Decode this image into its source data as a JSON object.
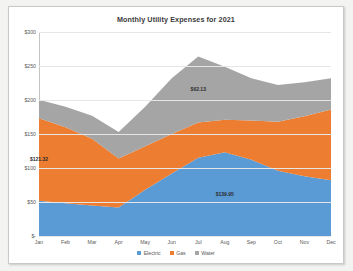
{
  "chart_data": {
    "type": "area",
    "stacked": true,
    "title": "Monthly Utility Expenses for 2021",
    "xlabel": "",
    "ylabel": "",
    "ylim": [
      0,
      300
    ],
    "yticks": [
      "$-",
      "$50",
      "$100",
      "$150",
      "$200",
      "$250",
      "$300"
    ],
    "ytick_values": [
      0,
      50,
      100,
      150,
      200,
      250,
      300
    ],
    "grid": true,
    "legend_position": "bottom",
    "categories": [
      "Jan",
      "Feb",
      "Mar",
      "Apr",
      "May",
      "Jun",
      "Jul",
      "Aug",
      "Sep",
      "Oct",
      "Nov",
      "Dec"
    ],
    "series": [
      {
        "name": "Electric",
        "color": "#5B9BD5",
        "values": [
          52,
          48,
          45,
          42,
          68,
          92,
          115,
          123,
          112,
          96,
          88,
          82
        ]
      },
      {
        "name": "Gas",
        "color": "#ED7D31",
        "values": [
          121.32,
          112,
          98,
          72,
          64,
          58,
          52,
          48,
          58,
          72,
          88,
          104
        ]
      },
      {
        "name": "Water",
        "color": "#A5A5A5",
        "values": [
          27,
          30,
          34,
          39,
          58,
          82,
          97,
          78,
          62,
          54,
          50,
          46
        ]
      }
    ],
    "annotations": [
      {
        "label": "$121.32",
        "series": "Gas",
        "category": "Jan"
      },
      {
        "label": "$62.13",
        "series": "Water",
        "category": "Jul"
      },
      {
        "label": "$139.95",
        "series": "Electric",
        "category": "Aug"
      }
    ],
    "legend": [
      {
        "label": "Electric",
        "color": "#5B9BD5"
      },
      {
        "label": "Gas",
        "color": "#ED7D31"
      },
      {
        "label": "Water",
        "color": "#A5A5A5"
      }
    ]
  }
}
